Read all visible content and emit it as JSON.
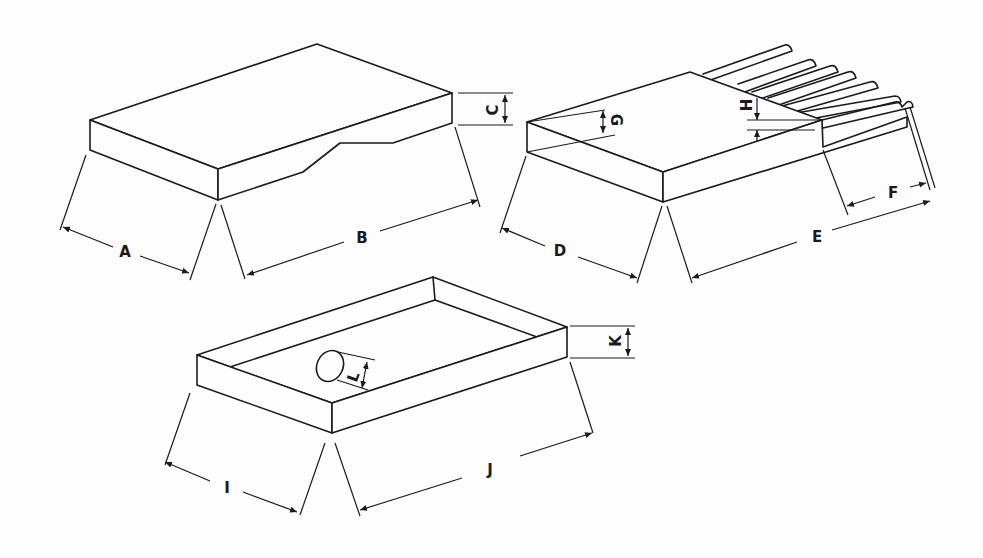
{
  "diagram": {
    "type": "isometric technical drawing",
    "figures": [
      {
        "id": "flat-sheet-with-notch",
        "dimension_labels": {
          "A": "A",
          "B": "B",
          "C": "C"
        }
      },
      {
        "id": "corrugated-sheet",
        "dimension_labels": {
          "D": "D",
          "E": "E",
          "F": "F",
          "G": "G",
          "H": "H"
        }
      },
      {
        "id": "tray-with-hole",
        "dimension_labels": {
          "I": "I",
          "J": "J",
          "K": "K",
          "L": "L"
        }
      }
    ]
  },
  "colors": {
    "line": "#1a1a1a",
    "background": "#fdfdfd"
  }
}
